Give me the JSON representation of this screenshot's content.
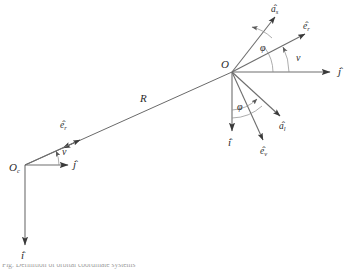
{
  "figure": {
    "title": "Definition of orbital coordinate systems",
    "caption_partial": "Fig. Definition of orbital coordinate systems",
    "background_color": "#ffffff",
    "line_color": "#6e6e6e",
    "text_color": "#2b2b2b",
    "arc_color": "#8a8a8a"
  },
  "frames": {
    "earth_frame": {
      "origin_label": "O",
      "origin_subscript": "c",
      "axes": [
        {
          "name": "j-axis",
          "label": "j",
          "hat": "^",
          "direction": "right"
        },
        {
          "name": "i-axis",
          "label": "i",
          "hat": "^",
          "direction": "down"
        }
      ],
      "vectors": [
        {
          "name": "e-r-vector",
          "label": "e",
          "hat": "^",
          "subscript": "r",
          "direction": "up-right"
        }
      ],
      "angles": [
        {
          "name": "nu-angle",
          "label": "ν",
          "between": "j-axis and e-r-vector"
        }
      ]
    },
    "satellite_frame": {
      "origin_label": "O",
      "origin_subscript": "",
      "axes": [
        {
          "name": "j-axis",
          "label": "j",
          "hat": "^",
          "direction": "right"
        },
        {
          "name": "i-axis",
          "label": "i",
          "hat": "^",
          "direction": "down"
        }
      ],
      "vectors": [
        {
          "name": "a-s-vector",
          "label": "a",
          "hat": "^",
          "subscript": "s",
          "direction": "up-right-steep"
        },
        {
          "name": "e-r-vector",
          "label": "e",
          "hat": "^",
          "subscript": "r",
          "direction": "up-right"
        },
        {
          "name": "a-l-vector",
          "label": "a",
          "hat": "^",
          "subscript": "l",
          "direction": "down-right"
        },
        {
          "name": "e-v-vector",
          "label": "e",
          "hat": "^",
          "subscript": "v",
          "direction": "down-right-steep"
        }
      ],
      "angles": [
        {
          "name": "phi-angle-upper",
          "label": "φ",
          "between": "a-s-vector and e-r-vector"
        },
        {
          "name": "nu-angle",
          "label": "ν",
          "between": "j-axis and e-r-vector"
        },
        {
          "name": "phi-angle-lower",
          "label": "φ",
          "between": "i-axis and a-l-vector"
        }
      ]
    }
  },
  "connector": {
    "name": "radius-vector",
    "label": "R",
    "from": "earth-frame-origin",
    "to": "satellite-frame-origin"
  },
  "labels": {
    "R": "R",
    "O": "O",
    "O_sub": "c",
    "i": "i",
    "j": "j",
    "e": "e",
    "a": "a",
    "sub_r": "r",
    "sub_v": "v",
    "sub_s": "s",
    "sub_l": "l",
    "nu": "ν",
    "phi": "φ",
    "hat": "ˆ"
  }
}
